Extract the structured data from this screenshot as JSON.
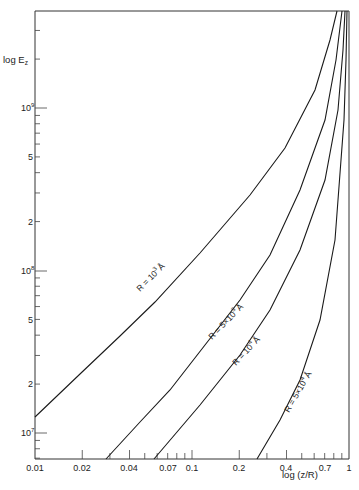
{
  "chart_data": {
    "type": "line",
    "title": "",
    "xlabel": "log (z/R)",
    "ylabel": "log E_z",
    "xscale": "log",
    "yscale": "log",
    "xlim": [
      0.01,
      1
    ],
    "ylim": [
      7000000.0,
      1800000000.0
    ],
    "grid": false,
    "legend": "inline curve labels",
    "x_ticks": [
      "0.01",
      "0.02",
      "0.04",
      "0.07",
      "0.1",
      "0.2",
      "0.4",
      "0.7",
      "1"
    ],
    "y_ticks": [
      "10^7",
      "2",
      "5",
      "10^8",
      "2",
      "5",
      "10^9"
    ],
    "series": [
      {
        "name": "R = 10^3 Å",
        "x": [
          0.01,
          0.02,
          0.04,
          0.1,
          0.2,
          0.4,
          0.7,
          0.9
        ],
        "y": [
          12000000.0,
          24000000.0,
          50000000.0,
          140000000.0,
          310000000.0,
          750000000.0,
          1500000000.0,
          1800000000.0
        ]
      },
      {
        "name": "R = 5×10^3 Å",
        "x": [
          0.028,
          0.05,
          0.1,
          0.2,
          0.4,
          0.7,
          0.95
        ],
        "y": [
          7000000.0,
          18000000.0,
          45000000.0,
          120000000.0,
          350000000.0,
          900000000.0,
          1800000000.0
        ]
      },
      {
        "name": "R = 10^4 Å",
        "x": [
          0.057,
          0.1,
          0.2,
          0.4,
          0.7,
          0.98
        ],
        "y": [
          7000000.0,
          15000000.0,
          38000000.0,
          110000000.0,
          320000000.0,
          1800000000.0
        ]
      },
      {
        "name": "R = 5×10^4 Å",
        "x": [
          0.26,
          0.4,
          0.6,
          0.8,
          0.95,
          1.0
        ],
        "y": [
          7000000.0,
          13000000.0,
          30000000.0,
          100000000.0,
          500000000.0,
          1800000000.0
        ]
      }
    ]
  },
  "axes": {
    "ylabel": "log E",
    "ylabel_sub": "z",
    "xlabel": "log (z/R)",
    "y_ticks": [
      {
        "base": "10",
        "exp": "9",
        "y": 108,
        "major": true
      },
      {
        "label": "5",
        "y": 157
      },
      {
        "label": "2",
        "y": 222
      },
      {
        "base": "10",
        "exp": "8",
        "y": 271,
        "major": true
      },
      {
        "label": "5",
        "y": 320
      },
      {
        "label": "2",
        "y": 384
      },
      {
        "base": "10",
        "exp": "7",
        "y": 433,
        "major": true
      }
    ],
    "x_ticks": [
      {
        "label": "0.01",
        "x": 35
      },
      {
        "label": "0.02",
        "x": 82
      },
      {
        "label": "0.04",
        "x": 129
      },
      {
        "label": "0.07",
        "x": 168
      },
      {
        "label": "0.1",
        "x": 192
      },
      {
        "label": "0.2",
        "x": 239
      },
      {
        "label": "0.4",
        "x": 286
      },
      {
        "label": "0.7",
        "x": 325
      },
      {
        "label": "1",
        "x": 349
      }
    ]
  },
  "curves": [
    {
      "label": "R = 10³ Å",
      "points": "35,417 80,374 120,336 155,302 200,253 250,195 285,148 315,90 330,40 337,11"
    },
    {
      "label": "R = 5×10³ Å",
      "points": "106,459 140,422 170,390 205,345 240,300 270,255 300,190 325,120 336,60 342,11"
    },
    {
      "label": "R = 10⁴ Å",
      "points": "154,459 200,405 240,355 270,310 300,250 325,180 338,110 343,50 345,11"
    },
    {
      "label": "R = 5×10⁴ Å",
      "points": "257,459 280,420 300,380 320,320 335,240 344,120 346,60 347,11"
    }
  ],
  "curve_labels": [
    {
      "text": "R = 10",
      "sup": "3",
      "unit": "Å",
      "x": 140,
      "y": 292,
      "angle": -45
    },
    {
      "text": "R = 5×10",
      "sup": "3",
      "unit": "Å",
      "x": 212,
      "y": 340,
      "angle": -46
    },
    {
      "text": "R = 10",
      "sup": "4",
      "unit": "Å",
      "x": 236,
      "y": 366,
      "angle": -47
    },
    {
      "text": "R = 5×10",
      "sup": "4",
      "unit": "Å",
      "x": 289,
      "y": 413,
      "angle": -60
    }
  ]
}
